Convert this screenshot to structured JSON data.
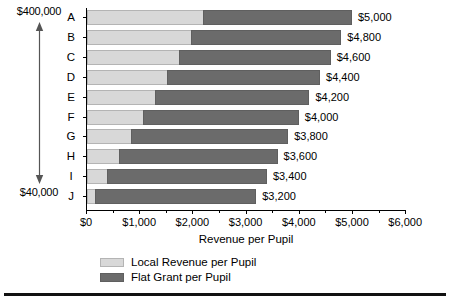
{
  "chart_data": {
    "type": "bar",
    "orientation": "horizontal",
    "stacked": true,
    "title": "",
    "xlabel": "Revenue per Pupil",
    "ylabel": "",
    "xlim": [
      0,
      6000
    ],
    "xticks": [
      0,
      1000,
      2000,
      3000,
      4000,
      5000,
      6000
    ],
    "xticklabels": [
      "$0",
      "$1,000",
      "$2,000",
      "$3,000",
      "$4,000",
      "$5,000",
      "$6,000"
    ],
    "grid": false,
    "legend_position": "bottom-left",
    "categories": [
      "A",
      "B",
      "C",
      "D",
      "E",
      "F",
      "G",
      "H",
      "I",
      "J"
    ],
    "series": [
      {
        "name": "Local Revenue per Pupil",
        "color": "#d8d8d8",
        "values": [
          2200,
          1975,
          1750,
          1525,
          1300,
          1075,
          850,
          625,
          400,
          175
        ]
      },
      {
        "name": "Flat Grant per Pupil",
        "color": "#6b6b6b",
        "values": [
          2800,
          2825,
          2850,
          2875,
          2900,
          2925,
          2950,
          2975,
          3000,
          3025
        ]
      }
    ],
    "totals": [
      5000,
      4800,
      4600,
      4400,
      4200,
      4000,
      3800,
      3600,
      3400,
      3200
    ],
    "total_labels": [
      "$5,000",
      "$4,800",
      "$4,600",
      "$4,400",
      "$4,200",
      "$4,000",
      "$3,800",
      "$3,600",
      "$3,400",
      "$3,200"
    ],
    "annotations": {
      "range_top": "$400,000",
      "range_bottom": "$40,000",
      "range_arrow": "double-headed-vertical-arrow"
    }
  },
  "legend": {
    "items": [
      {
        "label": "Local Revenue per Pupil",
        "color": "#d8d8d8"
      },
      {
        "label": "Flat Grant per Pupil",
        "color": "#6b6b6b"
      }
    ]
  }
}
